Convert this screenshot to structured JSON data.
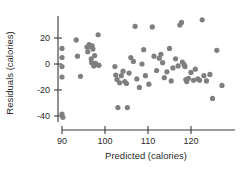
{
  "chart_data": {
    "type": "scatter",
    "title": "",
    "xlabel": "Predicted (calories)",
    "ylabel": "Residuals (calories)",
    "xlim": [
      87,
      130
    ],
    "ylim": [
      -46,
      36
    ],
    "xticks": [
      90,
      100,
      110,
      120
    ],
    "yticks": [
      20,
      0,
      -20,
      -40
    ],
    "xticklabels": [
      "90",
      "100",
      "110",
      "120"
    ],
    "yticklabels": [
      "20",
      "0",
      "-20",
      "-40"
    ],
    "grid": false,
    "legend": null,
    "marker": {
      "shape": "circle",
      "color": "#7f7f7f",
      "size": 4.6
    },
    "points": [
      {
        "x": 90.0,
        "y": 12.0
      },
      {
        "x": 90.0,
        "y": 5.0
      },
      {
        "x": 90.0,
        "y": -2.0
      },
      {
        "x": 90.0,
        "y": -10.0
      },
      {
        "x": 90.0,
        "y": -38.5
      },
      {
        "x": 90.2,
        "y": -41.0
      },
      {
        "x": 93.3,
        "y": 18.5
      },
      {
        "x": 93.6,
        "y": 6.0
      },
      {
        "x": 94.3,
        "y": -9.5
      },
      {
        "x": 95.8,
        "y": 13.0
      },
      {
        "x": 96.0,
        "y": 9.5
      },
      {
        "x": 96.3,
        "y": 15.0
      },
      {
        "x": 96.6,
        "y": 13.5
      },
      {
        "x": 96.8,
        "y": 4.0
      },
      {
        "x": 96.9,
        "y": 1.0
      },
      {
        "x": 97.0,
        "y": 14.0
      },
      {
        "x": 97.2,
        "y": 11.5
      },
      {
        "x": 97.4,
        "y": -1.5
      },
      {
        "x": 97.6,
        "y": 6.5
      },
      {
        "x": 97.8,
        "y": 0.5
      },
      {
        "x": 98.0,
        "y": -0.5
      },
      {
        "x": 98.4,
        "y": 22.5
      },
      {
        "x": 98.6,
        "y": -1.0
      },
      {
        "x": 102.3,
        "y": -2.0
      },
      {
        "x": 102.5,
        "y": -8.5
      },
      {
        "x": 102.8,
        "y": -12.0
      },
      {
        "x": 103.0,
        "y": -33.5
      },
      {
        "x": 103.4,
        "y": -14.5
      },
      {
        "x": 103.8,
        "y": -9.0
      },
      {
        "x": 104.2,
        "y": -5.5
      },
      {
        "x": 104.6,
        "y": -13.5
      },
      {
        "x": 105.0,
        "y": -15.0
      },
      {
        "x": 105.2,
        "y": -33.5
      },
      {
        "x": 105.6,
        "y": -7.0
      },
      {
        "x": 106.0,
        "y": 5.0
      },
      {
        "x": 106.6,
        "y": 2.0
      },
      {
        "x": 107.0,
        "y": 29.0
      },
      {
        "x": 107.4,
        "y": -11.5
      },
      {
        "x": 108.0,
        "y": -18.0
      },
      {
        "x": 108.6,
        "y": 0.0
      },
      {
        "x": 109.0,
        "y": 11.0
      },
      {
        "x": 109.4,
        "y": -9.0
      },
      {
        "x": 110.2,
        "y": -15.5
      },
      {
        "x": 111.0,
        "y": 28.5
      },
      {
        "x": 111.4,
        "y": 6.0
      },
      {
        "x": 112.0,
        "y": -5.0
      },
      {
        "x": 112.6,
        "y": 4.5
      },
      {
        "x": 113.0,
        "y": 7.5
      },
      {
        "x": 113.4,
        "y": 1.0
      },
      {
        "x": 113.8,
        "y": -10.5
      },
      {
        "x": 114.4,
        "y": -6.0
      },
      {
        "x": 115.0,
        "y": 12.0
      },
      {
        "x": 115.4,
        "y": -13.0
      },
      {
        "x": 115.8,
        "y": -3.0
      },
      {
        "x": 116.4,
        "y": 4.0
      },
      {
        "x": 117.0,
        "y": -1.5
      },
      {
        "x": 117.4,
        "y": 30.0
      },
      {
        "x": 117.8,
        "y": 32.0
      },
      {
        "x": 118.0,
        "y": 1.5
      },
      {
        "x": 118.4,
        "y": -0.5
      },
      {
        "x": 118.6,
        "y": -2.0
      },
      {
        "x": 118.8,
        "y": -12.0
      },
      {
        "x": 119.0,
        "y": -13.5
      },
      {
        "x": 119.4,
        "y": -11.0
      },
      {
        "x": 120.0,
        "y": -6.5
      },
      {
        "x": 120.6,
        "y": -12.5
      },
      {
        "x": 121.0,
        "y": -4.0
      },
      {
        "x": 121.6,
        "y": -11.5
      },
      {
        "x": 122.0,
        "y": -12.5
      },
      {
        "x": 122.6,
        "y": 34.0
      },
      {
        "x": 123.0,
        "y": -9.0
      },
      {
        "x": 123.6,
        "y": -13.0
      },
      {
        "x": 124.4,
        "y": -8.0
      },
      {
        "x": 125.0,
        "y": -26.5
      },
      {
        "x": 126.0,
        "y": 10.5
      },
      {
        "x": 127.2,
        "y": -16.5
      }
    ]
  }
}
